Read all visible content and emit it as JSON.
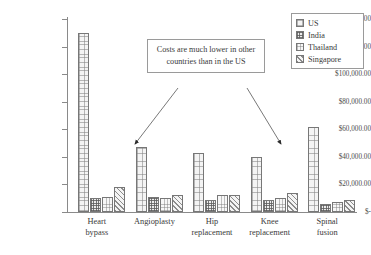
{
  "legend": {
    "position": "top-right",
    "entries": [
      {
        "label": "US",
        "pattern": "fine-grid"
      },
      {
        "label": "India",
        "pattern": "dense-checker"
      },
      {
        "label": "Thailand",
        "pattern": "light-grid"
      },
      {
        "label": "Singapore",
        "pattern": "diagonal-hatch"
      }
    ]
  },
  "annotation": {
    "text": "Costs are much lower in other countries than in the US",
    "arrows": 2
  },
  "axis": {
    "y_ticks": [
      "$140,000.00",
      "$120,000.00",
      "$100,000.00",
      "$80,000.00",
      "$60,000.00",
      "$40,000.00",
      "$20,000.00",
      "$-"
    ]
  },
  "chart_data": {
    "type": "bar",
    "title": "",
    "xlabel": "",
    "ylabel": "",
    "ylim": [
      0,
      140000
    ],
    "ytick_values": [
      0,
      20000,
      40000,
      60000,
      80000,
      100000,
      120000,
      140000
    ],
    "grid": false,
    "categories": [
      "Heart\nbypass",
      "Angioplasty",
      "Hip\nreplacement",
      "Knee\nreplacement",
      "Spinal\nfusion"
    ],
    "series": [
      {
        "name": "US",
        "values": [
          130000,
          47000,
          43000,
          40000,
          62000
        ]
      },
      {
        "name": "India",
        "values": [
          10000,
          11000,
          9000,
          9000,
          5500
        ]
      },
      {
        "name": "Thailand",
        "values": [
          11000,
          10000,
          12000,
          10500,
          7000
        ]
      },
      {
        "name": "Singapore",
        "values": [
          18500,
          12500,
          12000,
          13500,
          9000
        ]
      }
    ]
  }
}
